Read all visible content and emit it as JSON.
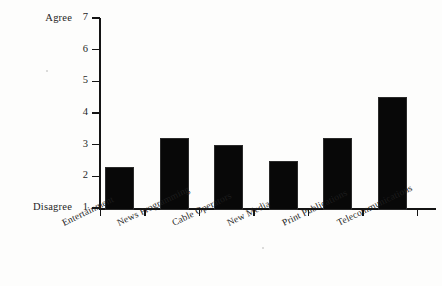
{
  "chart_data": {
    "type": "bar",
    "title": "",
    "subtitle": "",
    "xlabel": "",
    "ylabel": "",
    "categories": [
      "Entertainment",
      "News Programming",
      "Cable Operators",
      "New Media",
      "Print Publications",
      "Telecommunications"
    ],
    "values": [
      2.3,
      3.2,
      3.0,
      2.5,
      3.2,
      4.5
    ],
    "ylim": [
      1,
      7
    ],
    "yticks": [
      1,
      2,
      3,
      4,
      5,
      6,
      7
    ],
    "ytick_labels": [
      "1",
      "2",
      "3",
      "4",
      "5",
      "6",
      "7"
    ],
    "y_axis_min_label": "Disagree",
    "y_axis_max_label": "Agree",
    "grid": false,
    "legend": null,
    "bar_color": "#080808",
    "axis_color": "#141414",
    "background_color": "#fdfdfc"
  }
}
